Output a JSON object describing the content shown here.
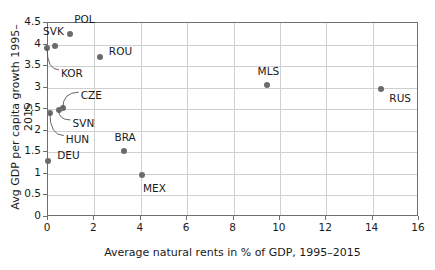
{
  "chart_data": {
    "type": "scatter",
    "title": "",
    "xlabel": "Average natural rents in % of GDP, 1995–2015",
    "ylabel": "Avg GDP per capita growth 1995–2015",
    "xlim": [
      0,
      16
    ],
    "ylim": [
      0,
      4.5
    ],
    "xticks": [
      "0",
      "2",
      "4",
      "6",
      "8",
      "10",
      "12",
      "14",
      "16"
    ],
    "xtick_values": [
      0,
      2,
      4,
      6,
      8,
      10,
      12,
      14,
      16
    ],
    "yticks": [
      "0",
      "0.5",
      "1",
      "1.5",
      "2",
      "2.5",
      "3",
      "3.5",
      "4",
      "4.5"
    ],
    "ytick_values": [
      0,
      0.5,
      1,
      1.5,
      2,
      2.5,
      3,
      3.5,
      4,
      4.5
    ],
    "grid": true,
    "legend": false,
    "marker_color": "#6b6b6b",
    "points": [
      {
        "label": "KOR",
        "x": 0.0,
        "y": 3.9,
        "label_dx": 14,
        "label_dy": 26,
        "leader": true
      },
      {
        "label": "SVK",
        "x": 0.35,
        "y": 3.95,
        "label_dx": -12,
        "label_dy": -14,
        "leader": false
      },
      {
        "label": "POL",
        "x": 1.0,
        "y": 4.22,
        "label_dx": 4,
        "label_dy": -14,
        "leader": false
      },
      {
        "label": "ROU",
        "x": 2.28,
        "y": 3.68,
        "label_dx": 9,
        "label_dy": -5,
        "leader": false
      },
      {
        "label": "HUN",
        "x": 0.12,
        "y": 2.4,
        "label_dx": 16,
        "label_dy": 27,
        "leader": true
      },
      {
        "label": "SVN",
        "x": 0.5,
        "y": 2.46,
        "label_dx": 14,
        "label_dy": 14,
        "leader": true
      },
      {
        "label": "CZE",
        "x": 0.68,
        "y": 2.5,
        "label_dx": 18,
        "label_dy": -12,
        "leader": true
      },
      {
        "label": "DEU",
        "x": 0.05,
        "y": 1.28,
        "label_dx": 9,
        "label_dy": -5,
        "leader": false
      },
      {
        "label": "BRA",
        "x": 3.3,
        "y": 1.5,
        "label_dx": -9,
        "label_dy": -13,
        "leader": false
      },
      {
        "label": "MEX",
        "x": 4.1,
        "y": 0.95,
        "label_dx": 1,
        "label_dy": 14,
        "leader": false
      },
      {
        "label": "MLS",
        "x": 9.47,
        "y": 3.05,
        "label_dx": -9,
        "label_dy": -13,
        "leader": false
      },
      {
        "label": "RUS",
        "x": 14.42,
        "y": 2.95,
        "label_dx": 8,
        "label_dy": 10,
        "leader": false
      }
    ]
  }
}
